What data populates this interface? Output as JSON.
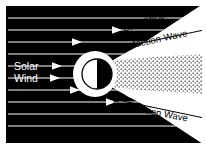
{
  "figure": {
    "background_color": "#ffffff",
    "field_color": "#000000",
    "stroke_color": "#ffffff",
    "label_color": "#000000",
    "width": 206,
    "height": 147
  },
  "labels": {
    "solar_wind_line1": "Solar",
    "solar_wind_line2": "Wind",
    "bow_shock": "Bow Shock",
    "rarefaction_wave_upper": "Rarefaction Wave",
    "rarefaction_wave_lower": "Rarefaction Wave"
  },
  "flow_arrows": {
    "count": 9,
    "direction": "right",
    "y_positions": [
      18,
      30,
      42,
      54,
      66,
      78,
      90,
      102,
      114,
      126
    ],
    "x_start": 8,
    "color": "#ffffff",
    "arrowheads_at": [
      30,
      54,
      66,
      90,
      102
    ]
  },
  "body": {
    "name": "planetary-obstacle",
    "cx": 97,
    "cy": 74,
    "r": 15,
    "dayside_color": "#ffffff",
    "nightside_color": "#000000"
  },
  "wake": {
    "name": "stippled-wake-region",
    "pattern": "stipple-dots",
    "dot_color": "#000000"
  }
}
